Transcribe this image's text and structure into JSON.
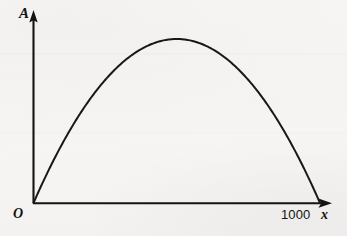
{
  "figure": {
    "background_color": "#f6f5f3",
    "ink_color": "#15130f",
    "width": 347,
    "height": 236
  },
  "labels": {
    "y_axis": "A",
    "x_axis": "x",
    "origin": "O",
    "x_tick": "1000"
  },
  "chart_data": {
    "type": "line",
    "title": "",
    "subtitle": "",
    "xlabel": "x",
    "ylabel": "A",
    "grid": false,
    "legend": null,
    "annotations": [
      {
        "text": "O",
        "role": "origin-label",
        "x": 0,
        "y": 0
      },
      {
        "text": "1000",
        "role": "x-axis-tick-label",
        "x": 1000,
        "y": 0
      },
      {
        "text": "A",
        "role": "y-axis-name"
      },
      {
        "text": "x",
        "role": "x-axis-name"
      }
    ],
    "axes": {
      "x_ticks": [
        1000
      ],
      "x_tick_labels": [
        "1000"
      ],
      "y_ticks": [],
      "y_tick_labels": [],
      "xlim": [
        0,
        1130
      ],
      "ylim": [
        0,
        147000
      ],
      "x_arrow": true,
      "y_arrow": true
    },
    "series": [
      {
        "name": "A(x)",
        "shape": "parabola",
        "equation": "A = x(1000 - x)/2",
        "x": [
          0,
          50,
          100,
          150,
          200,
          250,
          300,
          350,
          400,
          450,
          500,
          550,
          600,
          650,
          700,
          750,
          800,
          850,
          900,
          950,
          1000
        ],
        "y": [
          0,
          23750,
          45000,
          63750,
          80000,
          93750,
          105000,
          113750,
          120000,
          123750,
          125000,
          123750,
          120000,
          113750,
          105000,
          93750,
          80000,
          63750,
          45000,
          23750,
          0
        ],
        "vertex": {
          "x": 500,
          "y": 125000
        },
        "x_intercepts": [
          0,
          1000
        ]
      }
    ]
  }
}
